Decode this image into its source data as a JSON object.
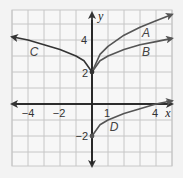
{
  "chart_data": {
    "type": "line",
    "title": "",
    "xlabel": "x",
    "ylabel": "y",
    "xlim": [
      -5,
      5
    ],
    "ylim": [
      -4,
      6
    ],
    "grid": true,
    "x_tick_labels": [
      "-4",
      "-2",
      "1",
      "4"
    ],
    "y_tick_labels": [
      "4",
      "2",
      "-2"
    ],
    "series": [
      {
        "name": "A",
        "start": [
          0,
          2
        ],
        "x": [
          0,
          0.5,
          1,
          2,
          3,
          4,
          5
        ],
        "y": [
          2,
          3.1,
          3.6,
          4.3,
          4.8,
          5.2,
          5.6
        ]
      },
      {
        "name": "B",
        "start": [
          0,
          2
        ],
        "x": [
          0,
          0.5,
          1,
          2,
          3,
          4,
          5
        ],
        "y": [
          2,
          2.7,
          3.0,
          3.4,
          3.7,
          3.9,
          4.1
        ]
      },
      {
        "name": "C",
        "start": [
          0,
          2
        ],
        "x": [
          0,
          -0.5,
          -1,
          -2,
          -3,
          -4,
          -5
        ],
        "y": [
          2,
          2.7,
          3.0,
          3.4,
          3.7,
          4.0,
          4.2
        ]
      },
      {
        "name": "D",
        "start": [
          0,
          -2
        ],
        "x": [
          0,
          0.5,
          1,
          2,
          3,
          4,
          5
        ],
        "y": [
          -2,
          -1.3,
          -1.0,
          -0.6,
          -0.3,
          0,
          0.2
        ]
      }
    ],
    "points": [
      [
        0,
        2
      ],
      [
        0,
        -2
      ]
    ]
  },
  "labels": {
    "x_axis": "x",
    "y_axis": "y",
    "tick_x_neg4": "−4",
    "tick_x_neg2": "−2",
    "tick_x_1": "1",
    "tick_x_4": "4",
    "tick_y_4": "4",
    "tick_y_2": "2",
    "tick_y_neg2": "−2",
    "curve_a": "A",
    "curve_b": "B",
    "curve_c": "C",
    "curve_d": "D"
  }
}
